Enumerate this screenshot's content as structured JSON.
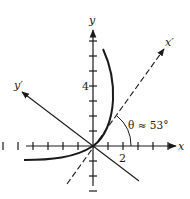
{
  "diagram": {
    "type": "rotated-axes-graph",
    "axes": {
      "x_label": "x",
      "y_label": "y",
      "x_prime_label": "x′",
      "y_prime_label": "y′"
    },
    "tick_labels": {
      "x": "2",
      "y": "4"
    },
    "angle_label": "θ ≈ 53°",
    "angle_degrees": 53,
    "x_ticks": [
      -6,
      -5,
      -4,
      -3,
      -2,
      -1,
      1,
      2,
      3,
      4,
      5
    ],
    "y_ticks": [
      -3,
      -2,
      -1,
      1,
      2,
      3,
      4,
      5,
      6,
      7
    ],
    "colors": {
      "ink": "#1a1a1a",
      "background": "#ffffff"
    }
  }
}
